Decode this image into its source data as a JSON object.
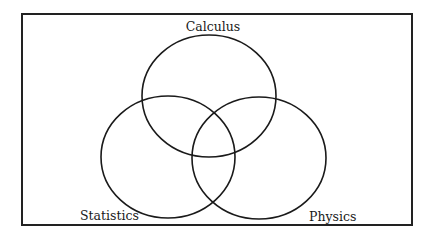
{
  "diagram": {
    "type": "venn",
    "frame": {
      "x": 22,
      "y": 14,
      "width": 390,
      "height": 211,
      "stroke": "#222222"
    },
    "sets": [
      {
        "id": "calculus",
        "label": "Calculus",
        "cx": 209,
        "cy": 96,
        "rx": 67,
        "ry": 61,
        "label_x": 213,
        "label_y": 31,
        "anchor": "middle"
      },
      {
        "id": "statistics",
        "label": "Statistics",
        "cx": 168,
        "cy": 157,
        "rx": 67,
        "ry": 61,
        "label_x": 80,
        "label_y": 220,
        "anchor": "start"
      },
      {
        "id": "physics",
        "label": "Physics",
        "cx": 259,
        "cy": 158,
        "rx": 67,
        "ry": 61,
        "label_x": 309,
        "label_y": 221,
        "anchor": "start"
      }
    ],
    "stroke_color": "#1a1a1a"
  }
}
